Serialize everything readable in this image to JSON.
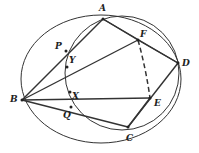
{
  "diagram": {
    "type": "geometry",
    "stroke_color": "#333333",
    "points": {
      "A": {
        "label": "A",
        "x": 103,
        "y": 19,
        "lx": 99,
        "ly": 4
      },
      "F": {
        "label": "F",
        "x": 138,
        "y": 40,
        "lx": 140,
        "ly": 30
      },
      "D": {
        "label": "D",
        "x": 178,
        "y": 63,
        "lx": 182,
        "ly": 59
      },
      "E": {
        "label": "E",
        "x": 150,
        "y": 98,
        "lx": 154,
        "ly": 99
      },
      "C": {
        "label": "C",
        "x": 128,
        "y": 127,
        "lx": 126,
        "ly": 134
      },
      "B": {
        "label": "B",
        "x": 22,
        "y": 100,
        "lx": 10,
        "ly": 95
      },
      "P": {
        "label": "P",
        "x": 66,
        "y": 51,
        "lx": 55,
        "ly": 42
      },
      "Y": {
        "label": "Y",
        "x": 67,
        "y": 67,
        "lx": 69,
        "ly": 56
      },
      "X": {
        "label": "X",
        "x": 70,
        "y": 92,
        "lx": 72,
        "ly": 92
      },
      "Q": {
        "label": "Q",
        "x": 71,
        "y": 107,
        "lx": 63,
        "ly": 111
      }
    },
    "segments": [
      [
        "B",
        "A"
      ],
      [
        "A",
        "F"
      ],
      [
        "F",
        "D"
      ],
      [
        "D",
        "C"
      ],
      [
        "C",
        "B"
      ],
      [
        "B",
        "F"
      ],
      [
        "B",
        "E"
      ],
      [
        "F",
        "E"
      ],
      [
        "E",
        "C"
      ],
      [
        "A",
        "D"
      ]
    ],
    "dashed": [
      [
        "F",
        "E"
      ]
    ],
    "circles": [
      {
        "name": "circle-ABCD",
        "cx": 101,
        "cy": 79,
        "rx": 80,
        "ry": 64
      },
      {
        "name": "circle-PAQD",
        "cx": 122,
        "cy": 73,
        "rx": 57,
        "ry": 57
      }
    ]
  }
}
